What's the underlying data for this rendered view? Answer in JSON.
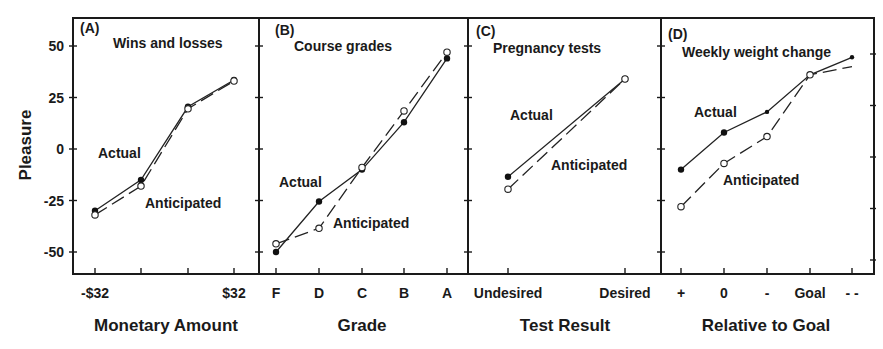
{
  "figure": {
    "y_axis_title": "Pleasure",
    "y_ticks": [
      50,
      25,
      0,
      -25,
      -50
    ],
    "y_tick_labels": [
      "50",
      "25",
      "0",
      "-25",
      "-50"
    ]
  },
  "chart_data": [
    {
      "type": "line",
      "panel": "(A)",
      "title": "Wins and losses",
      "xlabel": "Monetary Amount",
      "ylabel": "Pleasure",
      "categories": [
        "-$32",
        "",
        "",
        "$32"
      ],
      "tick_labels": [
        "-$32",
        "$32"
      ],
      "ylim": [
        -60,
        65
      ],
      "series": [
        {
          "name": "Actual",
          "marker": "filled",
          "values": [
            -30,
            -15,
            20.5,
            33.5
          ]
        },
        {
          "name": "Anticipated",
          "marker": "open",
          "dashed": true,
          "values": [
            -32,
            -18,
            19.5,
            33
          ]
        }
      ],
      "annotations": [
        "Actual",
        "Anticipated"
      ]
    },
    {
      "type": "line",
      "panel": "(B)",
      "title": "Course grades",
      "xlabel": "Grade",
      "ylabel": "Pleasure",
      "categories": [
        "F",
        "D",
        "C",
        "B",
        "A"
      ],
      "tick_labels": [
        "F",
        "D",
        "C",
        "B",
        "A"
      ],
      "ylim": [
        -60,
        65
      ],
      "series": [
        {
          "name": "Actual",
          "marker": "filled",
          "values": [
            -50,
            -25.5,
            -10,
            13,
            44
          ]
        },
        {
          "name": "Anticipated",
          "marker": "open",
          "dashed": true,
          "values": [
            -46,
            -38.5,
            -9,
            18.5,
            47
          ]
        }
      ],
      "annotations": [
        "Actual",
        "Anticipated"
      ]
    },
    {
      "type": "line",
      "panel": "(C)",
      "title": "Pregnancy tests",
      "xlabel": "Test Result",
      "ylabel": "Pleasure",
      "categories": [
        "Undesired",
        "Desired"
      ],
      "tick_labels": [
        "Undesired",
        "Desired"
      ],
      "ylim": [
        -60,
        65
      ],
      "series": [
        {
          "name": "Actual",
          "marker": "filled",
          "values": [
            -13.5,
            34
          ]
        },
        {
          "name": "Anticipated",
          "marker": "open",
          "dashed": true,
          "values": [
            -19.5,
            34
          ]
        }
      ],
      "annotations": [
        "Actual",
        "Anticipated"
      ]
    },
    {
      "type": "line",
      "panel": "(D)",
      "title": "Weekly weight change",
      "xlabel": "Relative to Goal",
      "ylabel": "Pleasure",
      "categories": [
        "+",
        "0",
        "-",
        "Goal",
        "- -"
      ],
      "tick_labels": [
        "+",
        "0",
        "-",
        "Goal",
        "- -"
      ],
      "ylim": [
        -60,
        65
      ],
      "series": [
        {
          "name": "Actual",
          "marker": "filled",
          "values": [
            -10,
            8,
            18,
            36,
            44.5
          ]
        },
        {
          "name": "Anticipated",
          "marker": "open",
          "dashed": true,
          "values": [
            -28,
            -7,
            6,
            36,
            40
          ]
        }
      ],
      "annotations": [
        "Actual",
        "Anticipated"
      ]
    }
  ]
}
